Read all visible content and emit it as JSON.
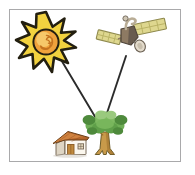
{
  "figure": {
    "title": "Sun and satellite transmitting to a house with a tree",
    "frame": {
      "x": 9,
      "y": 9,
      "width": 172,
      "height": 153,
      "border_color": "#a9a9ab",
      "background_color": "#ffffff"
    },
    "page_background": "#ffffff"
  },
  "objects": {
    "sun": {
      "label": "sun",
      "center_x": 46,
      "center_y": 42,
      "ray_outer_radius": 30,
      "ray_count": 12,
      "disk_radius": 13,
      "outline_color": "#231f10",
      "ray_fill_color": "#f2d23f",
      "disk_fill_color": "#f0a23c",
      "disk_highlight_color": "#f6c86a",
      "swirl_color": "#c4731f"
    },
    "satellite": {
      "label": "satellite",
      "center_x": 128,
      "center_y": 35,
      "body_color": "#8d7a63",
      "body_shadow_color": "#5c5148",
      "panel_color": "#ded78f",
      "panel_edge_color": "#8f8a4e",
      "panel_cell_color": "#b9b264",
      "dish_color": "#cfc6b4",
      "mast_color": "#b9ad96"
    },
    "house": {
      "label": "house",
      "center_x": 71,
      "center_y": 146,
      "wall_color": "#fbf7ee",
      "wall_shadow_color": "#ded5c4",
      "roof_color": "#b4642a",
      "roof_highlight_color": "#d78a45",
      "door_color": "#c08a3e",
      "door_frame_color": "#8a5a22",
      "window_color": "#e8dcc2",
      "outline_color": "#6b5b49"
    },
    "tree": {
      "label": "tree",
      "center_x": 105,
      "center_y": 141,
      "canopy_color": "#6fae56",
      "canopy_dark_color": "#4e8a3c",
      "canopy_light_color": "#9ac97e",
      "trunk_color": "#c89a4a",
      "trunk_dark_color": "#9a6f2c",
      "outline_color": "#6b5b2a"
    }
  },
  "connectors": [
    {
      "name": "sun-to-tree-beam",
      "from": "sun",
      "to": "tree",
      "x1": 60,
      "y1": 58,
      "x2": 100,
      "y2": 125,
      "color": "#2b2b2b",
      "width": 1.9
    },
    {
      "name": "satellite-to-tree-beam",
      "from": "satellite",
      "to": "tree",
      "x1": 126,
      "y1": 56,
      "x2": 103,
      "y2": 125,
      "color": "#2b2b2b",
      "width": 1.9
    }
  ]
}
